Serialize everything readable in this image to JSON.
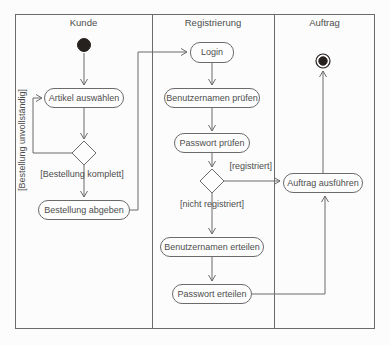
{
  "colors": {
    "background": "#fcfcfc",
    "line": "#6b6b6b",
    "text": "#4d4d4d",
    "node-fill": "#fdfdfd",
    "start-fill": "#26211f"
  },
  "lanes": {
    "kunde": "Kunde",
    "registrierung": "Registrierung",
    "auftrag": "Auftrag"
  },
  "nodes": {
    "artikel_auswaehlen": "Artikel auswählen",
    "bestellung_abgeben": "Bestellung abgeben",
    "login": "Login",
    "benutzernamen_pruefen": "Benutzernamen prüfen",
    "passwort_pruefen": "Passwort prüfen",
    "benutzernamen_erteilen": "Benutzernamen erteilen",
    "passwort_erteilen": "Passwort erteilen",
    "auftrag_ausfuehren": "Auftrag ausführen"
  },
  "guards": {
    "bestellung_unvollstaendig": "[Bestellung unvollständig]",
    "bestellung_komplett": "[Bestellung komplett]",
    "registriert": "[registriert]",
    "nicht_registriert": "[nicht registriert]"
  }
}
